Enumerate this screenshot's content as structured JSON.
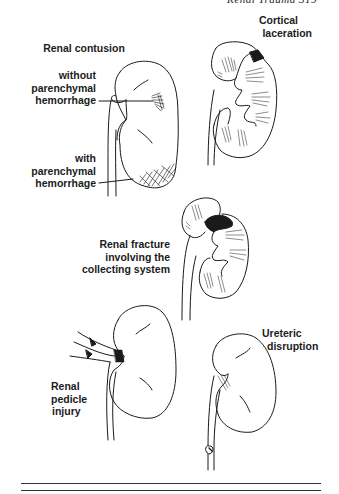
{
  "page": {
    "running_header": "Renal Trauma   319"
  },
  "figure": {
    "panels": [
      {
        "id": "renal-contusion",
        "title": "Renal contusion",
        "labels": [
          "without",
          "parenchymal",
          "hemorrhage"
        ],
        "labels_2": [
          "with",
          "parenchymal",
          "hemorrhage"
        ]
      },
      {
        "id": "cortical-laceration",
        "title_lines": [
          "Cortical",
          "laceration"
        ]
      },
      {
        "id": "renal-fracture",
        "title_lines": [
          "Renal fracture",
          "involving the",
          "collecting system"
        ]
      },
      {
        "id": "renal-pedicle-injury",
        "title_lines": [
          "Renal",
          "pedicle",
          "injury"
        ]
      },
      {
        "id": "ureteric-disruption",
        "title_lines": [
          "Ureteric",
          "disruption"
        ]
      }
    ]
  },
  "colors": {
    "ink": "#1a1a1a",
    "background": "#ffffff"
  }
}
